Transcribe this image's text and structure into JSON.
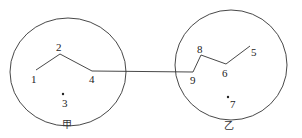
{
  "diagram": {
    "regions": [
      {
        "id": "jia",
        "label": "甲",
        "cx": 68,
        "cy": 72,
        "rx": 58,
        "ry": 54,
        "label_x": 67,
        "label_y": 128
      },
      {
        "id": "yi",
        "label": "乙",
        "cx": 231,
        "cy": 65,
        "rx": 56,
        "ry": 55,
        "label_x": 229,
        "label_y": 129
      }
    ],
    "nodes": [
      {
        "id": "1",
        "label": "1",
        "x": 36,
        "y": 70,
        "lx": 31,
        "ly": 83
      },
      {
        "id": "2",
        "label": "2",
        "x": 60,
        "y": 54,
        "lx": 56,
        "ly": 51
      },
      {
        "id": "3",
        "label": "3",
        "x": 63,
        "y": 94,
        "lx": 62,
        "ly": 107,
        "dot": true
      },
      {
        "id": "4",
        "label": "4",
        "x": 92,
        "y": 71,
        "lx": 89,
        "ly": 83
      },
      {
        "id": "5",
        "label": "5",
        "x": 250,
        "y": 46,
        "lx": 251,
        "ly": 56
      },
      {
        "id": "6",
        "label": "6",
        "x": 226,
        "y": 64,
        "lx": 222,
        "ly": 77
      },
      {
        "id": "7",
        "label": "7",
        "x": 228,
        "y": 97,
        "lx": 230,
        "ly": 108,
        "dot": true
      },
      {
        "id": "8",
        "label": "8",
        "x": 201,
        "y": 55,
        "lx": 197,
        "ly": 53
      },
      {
        "id": "9",
        "label": "9",
        "x": 193,
        "y": 72,
        "lx": 190,
        "ly": 84
      }
    ],
    "edges": [
      [
        "1",
        "2"
      ],
      [
        "2",
        "4"
      ],
      [
        "4",
        "9"
      ],
      [
        "9",
        "8"
      ],
      [
        "8",
        "6"
      ],
      [
        "6",
        "5"
      ]
    ],
    "stroke_color": "#333333"
  }
}
